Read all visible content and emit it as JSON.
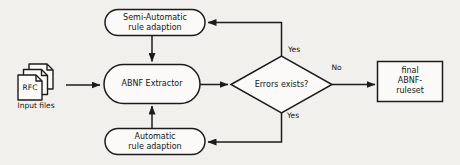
{
  "diagram": {
    "nodes": {
      "input_files": {
        "doc_label": "RFC",
        "caption": "Input files"
      },
      "semi_automatic": {
        "label": "Semi-Automatic\nrule adaption"
      },
      "abnf_extractor": {
        "label": "ABNF Extractor"
      },
      "automatic": {
        "label": "Automatic\nrule adaption"
      },
      "errors_decision": {
        "label": "Errors exists?"
      },
      "final_ruleset": {
        "label": "final\nABNF-ruleset"
      }
    },
    "edge_labels": {
      "yes_top": "Yes",
      "yes_bottom": "Yes",
      "no": "No"
    },
    "colors": {
      "background": "#f1f0ec",
      "node_fill": "#fbfaf8",
      "stroke": "#1c1c1c",
      "text": "#151515"
    }
  }
}
